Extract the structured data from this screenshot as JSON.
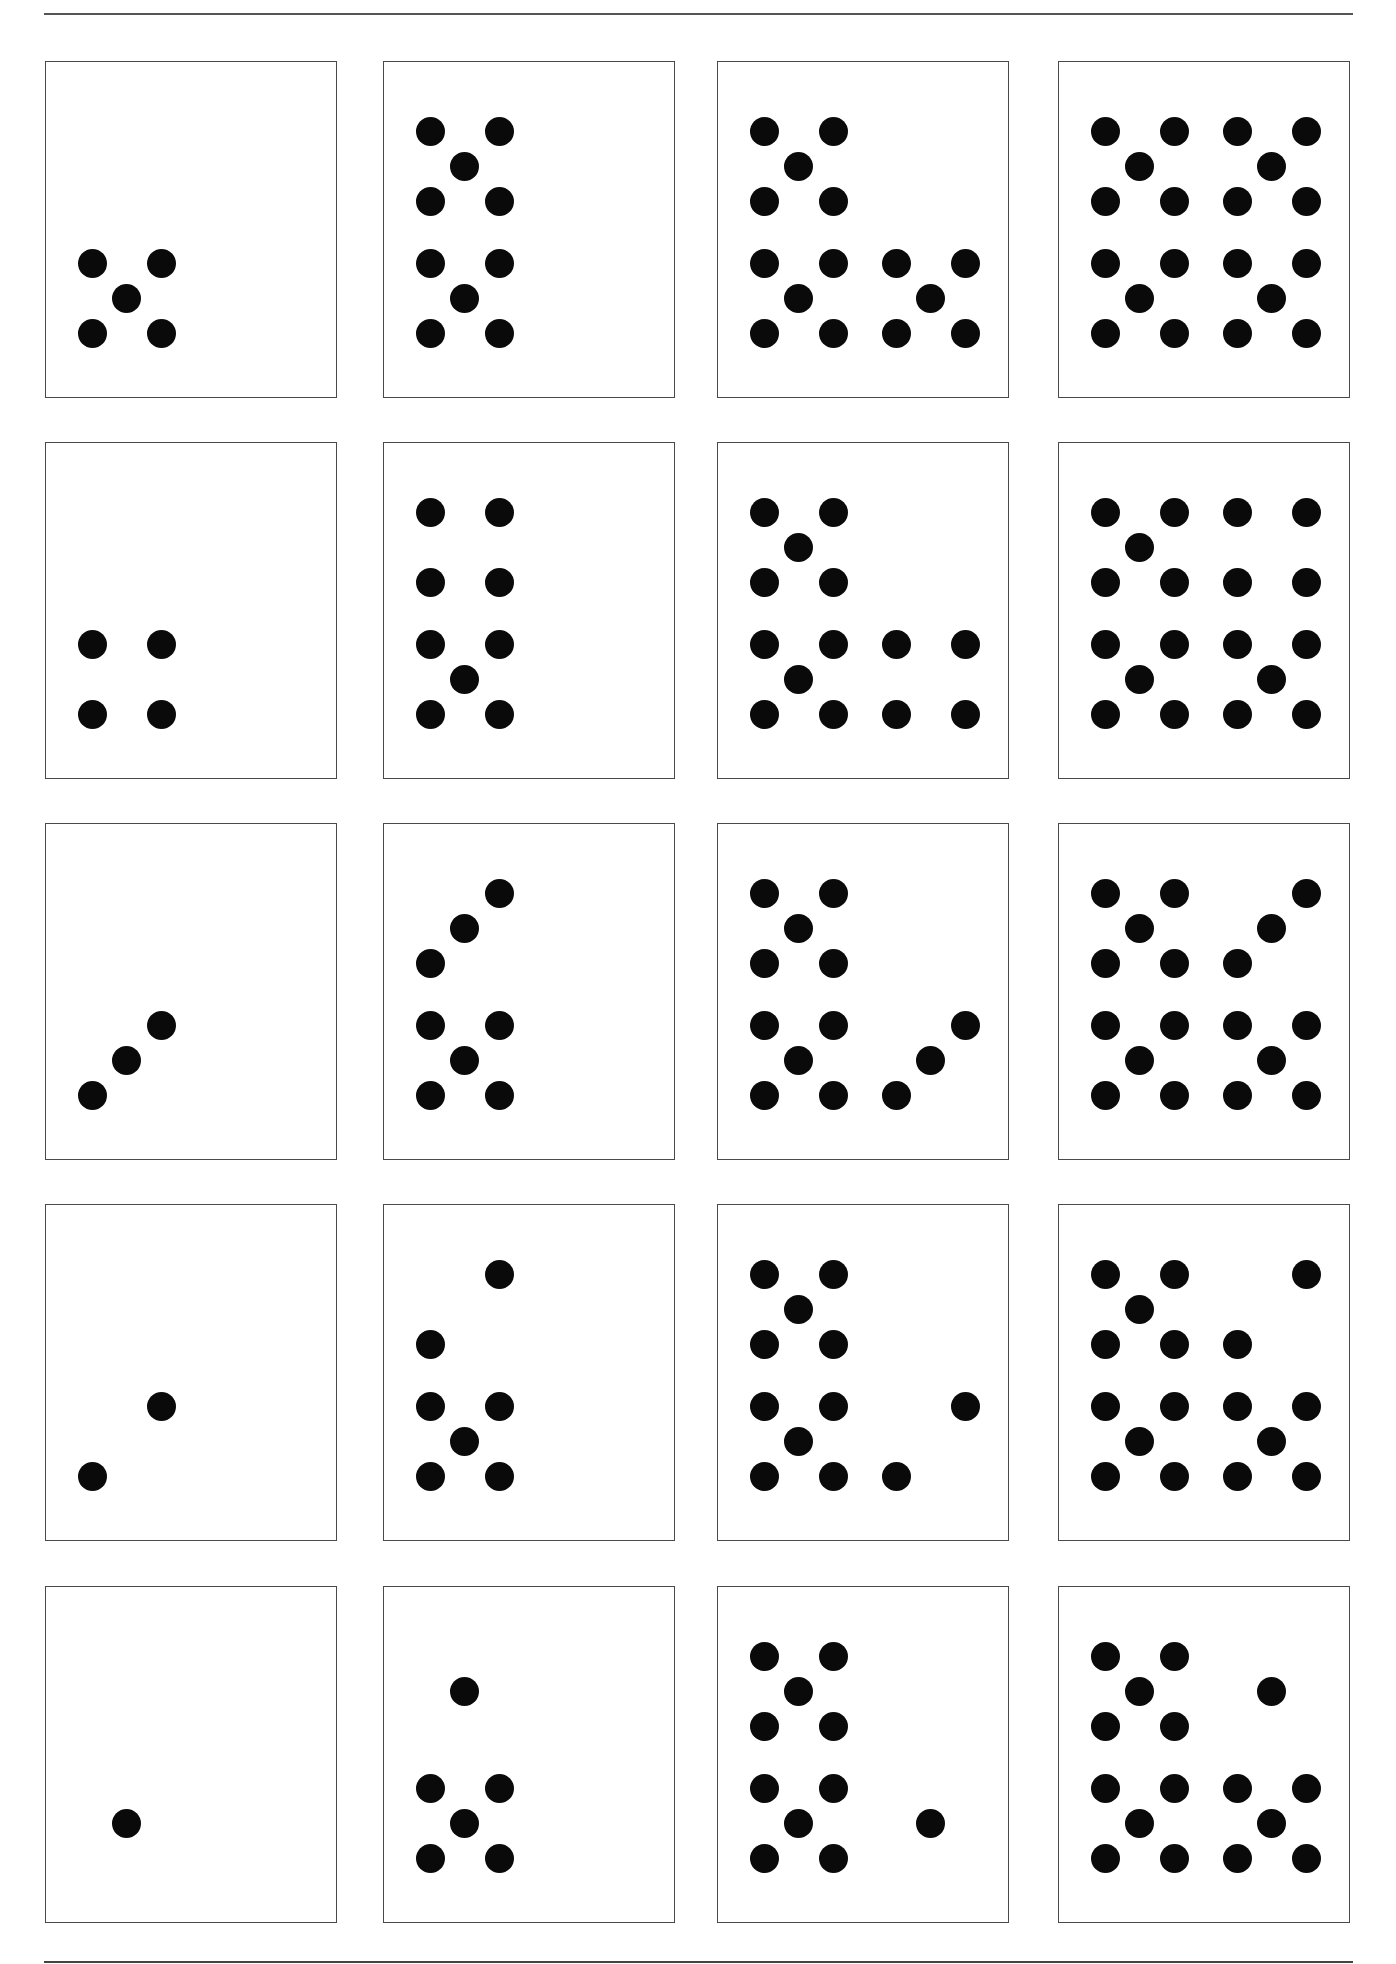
{
  "worksheet": {
    "layout": {
      "columns_x": [
        45,
        383,
        717,
        1058
      ],
      "rows_y": [
        61,
        442,
        823,
        1204,
        1586
      ],
      "lattice_x": [
        46,
        80,
        115,
        178,
        212,
        247
      ],
      "lattice_y": [
        69,
        104,
        139,
        201,
        236,
        271
      ]
    },
    "colors": {
      "dot": "#0a0a0a",
      "border": "#4a4a4a",
      "rule": "#555555",
      "background": "#ffffff"
    },
    "cards": [
      {
        "row": 0,
        "col": 0,
        "count": 5,
        "dots": [
          [
            0,
            3
          ],
          [
            2,
            3
          ],
          [
            1,
            4
          ],
          [
            0,
            5
          ],
          [
            2,
            5
          ]
        ]
      },
      {
        "row": 0,
        "col": 1,
        "count": 10,
        "dots": [
          [
            0,
            0
          ],
          [
            2,
            0
          ],
          [
            1,
            1
          ],
          [
            0,
            2
          ],
          [
            2,
            2
          ],
          [
            0,
            3
          ],
          [
            2,
            3
          ],
          [
            1,
            4
          ],
          [
            0,
            5
          ],
          [
            2,
            5
          ]
        ]
      },
      {
        "row": 0,
        "col": 2,
        "count": 15,
        "dots": [
          [
            0,
            0
          ],
          [
            2,
            0
          ],
          [
            1,
            1
          ],
          [
            0,
            2
          ],
          [
            2,
            2
          ],
          [
            0,
            3
          ],
          [
            2,
            3
          ],
          [
            1,
            4
          ],
          [
            0,
            5
          ],
          [
            2,
            5
          ],
          [
            3,
            3
          ],
          [
            5,
            3
          ],
          [
            4,
            4
          ],
          [
            3,
            5
          ],
          [
            5,
            5
          ]
        ]
      },
      {
        "row": 0,
        "col": 3,
        "count": 20,
        "dots": [
          [
            0,
            0
          ],
          [
            2,
            0
          ],
          [
            1,
            1
          ],
          [
            0,
            2
          ],
          [
            2,
            2
          ],
          [
            3,
            0
          ],
          [
            5,
            0
          ],
          [
            4,
            1
          ],
          [
            3,
            2
          ],
          [
            5,
            2
          ],
          [
            0,
            3
          ],
          [
            2,
            3
          ],
          [
            1,
            4
          ],
          [
            0,
            5
          ],
          [
            2,
            5
          ],
          [
            3,
            3
          ],
          [
            5,
            3
          ],
          [
            4,
            4
          ],
          [
            3,
            5
          ],
          [
            5,
            5
          ]
        ]
      },
      {
        "row": 1,
        "col": 0,
        "count": 4,
        "dots": [
          [
            0,
            3
          ],
          [
            2,
            3
          ],
          [
            0,
            5
          ],
          [
            2,
            5
          ]
        ]
      },
      {
        "row": 1,
        "col": 1,
        "count": 9,
        "dots": [
          [
            0,
            0
          ],
          [
            2,
            0
          ],
          [
            0,
            2
          ],
          [
            2,
            2
          ],
          [
            0,
            3
          ],
          [
            2,
            3
          ],
          [
            1,
            4
          ],
          [
            0,
            5
          ],
          [
            2,
            5
          ]
        ]
      },
      {
        "row": 1,
        "col": 2,
        "count": 14,
        "dots": [
          [
            0,
            0
          ],
          [
            2,
            0
          ],
          [
            1,
            1
          ],
          [
            0,
            2
          ],
          [
            2,
            2
          ],
          [
            0,
            3
          ],
          [
            2,
            3
          ],
          [
            1,
            4
          ],
          [
            0,
            5
          ],
          [
            2,
            5
          ],
          [
            3,
            3
          ],
          [
            5,
            3
          ],
          [
            3,
            5
          ],
          [
            5,
            5
          ]
        ]
      },
      {
        "row": 1,
        "col": 3,
        "count": 19,
        "dots": [
          [
            0,
            0
          ],
          [
            2,
            0
          ],
          [
            1,
            1
          ],
          [
            0,
            2
          ],
          [
            2,
            2
          ],
          [
            3,
            0
          ],
          [
            5,
            0
          ],
          [
            3,
            2
          ],
          [
            5,
            2
          ],
          [
            0,
            3
          ],
          [
            2,
            3
          ],
          [
            1,
            4
          ],
          [
            0,
            5
          ],
          [
            2,
            5
          ],
          [
            3,
            3
          ],
          [
            5,
            3
          ],
          [
            4,
            4
          ],
          [
            3,
            5
          ],
          [
            5,
            5
          ]
        ]
      },
      {
        "row": 2,
        "col": 0,
        "count": 3,
        "dots": [
          [
            0,
            5
          ],
          [
            1,
            4
          ],
          [
            2,
            3
          ]
        ]
      },
      {
        "row": 2,
        "col": 1,
        "count": 8,
        "dots": [
          [
            2,
            0
          ],
          [
            1,
            1
          ],
          [
            0,
            2
          ],
          [
            0,
            3
          ],
          [
            2,
            3
          ],
          [
            1,
            4
          ],
          [
            0,
            5
          ],
          [
            2,
            5
          ]
        ]
      },
      {
        "row": 2,
        "col": 2,
        "count": 13,
        "dots": [
          [
            0,
            0
          ],
          [
            2,
            0
          ],
          [
            1,
            1
          ],
          [
            0,
            2
          ],
          [
            2,
            2
          ],
          [
            0,
            3
          ],
          [
            2,
            3
          ],
          [
            1,
            4
          ],
          [
            0,
            5
          ],
          [
            2,
            5
          ],
          [
            5,
            3
          ],
          [
            4,
            4
          ],
          [
            3,
            5
          ]
        ]
      },
      {
        "row": 2,
        "col": 3,
        "count": 18,
        "dots": [
          [
            0,
            0
          ],
          [
            2,
            0
          ],
          [
            1,
            1
          ],
          [
            0,
            2
          ],
          [
            2,
            2
          ],
          [
            5,
            0
          ],
          [
            4,
            1
          ],
          [
            3,
            2
          ],
          [
            0,
            3
          ],
          [
            2,
            3
          ],
          [
            1,
            4
          ],
          [
            0,
            5
          ],
          [
            2,
            5
          ],
          [
            3,
            3
          ],
          [
            5,
            3
          ],
          [
            4,
            4
          ],
          [
            3,
            5
          ],
          [
            5,
            5
          ]
        ]
      },
      {
        "row": 3,
        "col": 0,
        "count": 2,
        "dots": [
          [
            0,
            5
          ],
          [
            2,
            3
          ]
        ]
      },
      {
        "row": 3,
        "col": 1,
        "count": 7,
        "dots": [
          [
            2,
            0
          ],
          [
            0,
            2
          ],
          [
            0,
            3
          ],
          [
            2,
            3
          ],
          [
            1,
            4
          ],
          [
            0,
            5
          ],
          [
            2,
            5
          ]
        ]
      },
      {
        "row": 3,
        "col": 2,
        "count": 12,
        "dots": [
          [
            0,
            0
          ],
          [
            2,
            0
          ],
          [
            1,
            1
          ],
          [
            0,
            2
          ],
          [
            2,
            2
          ],
          [
            0,
            3
          ],
          [
            2,
            3
          ],
          [
            1,
            4
          ],
          [
            0,
            5
          ],
          [
            2,
            5
          ],
          [
            5,
            3
          ],
          [
            3,
            5
          ]
        ]
      },
      {
        "row": 3,
        "col": 3,
        "count": 17,
        "dots": [
          [
            0,
            0
          ],
          [
            2,
            0
          ],
          [
            1,
            1
          ],
          [
            0,
            2
          ],
          [
            2,
            2
          ],
          [
            5,
            0
          ],
          [
            3,
            2
          ],
          [
            0,
            3
          ],
          [
            2,
            3
          ],
          [
            1,
            4
          ],
          [
            0,
            5
          ],
          [
            2,
            5
          ],
          [
            3,
            3
          ],
          [
            5,
            3
          ],
          [
            4,
            4
          ],
          [
            3,
            5
          ],
          [
            5,
            5
          ]
        ]
      },
      {
        "row": 4,
        "col": 0,
        "count": 1,
        "dots": [
          [
            1,
            4
          ]
        ]
      },
      {
        "row": 4,
        "col": 1,
        "count": 6,
        "dots": [
          [
            1,
            1
          ],
          [
            0,
            3
          ],
          [
            2,
            3
          ],
          [
            1,
            4
          ],
          [
            0,
            5
          ],
          [
            2,
            5
          ]
        ]
      },
      {
        "row": 4,
        "col": 2,
        "count": 11,
        "dots": [
          [
            0,
            0
          ],
          [
            2,
            0
          ],
          [
            1,
            1
          ],
          [
            0,
            2
          ],
          [
            2,
            2
          ],
          [
            0,
            3
          ],
          [
            2,
            3
          ],
          [
            1,
            4
          ],
          [
            0,
            5
          ],
          [
            2,
            5
          ],
          [
            4,
            4
          ]
        ]
      },
      {
        "row": 4,
        "col": 3,
        "count": 16,
        "dots": [
          [
            0,
            0
          ],
          [
            2,
            0
          ],
          [
            1,
            1
          ],
          [
            0,
            2
          ],
          [
            2,
            2
          ],
          [
            4,
            1
          ],
          [
            0,
            3
          ],
          [
            2,
            3
          ],
          [
            1,
            4
          ],
          [
            0,
            5
          ],
          [
            2,
            5
          ],
          [
            3,
            3
          ],
          [
            5,
            3
          ],
          [
            4,
            4
          ],
          [
            3,
            5
          ],
          [
            5,
            5
          ]
        ]
      }
    ]
  }
}
